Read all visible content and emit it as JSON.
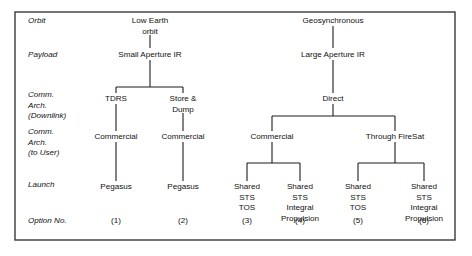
{
  "figure": {
    "type": "tree-diagram",
    "frame": {
      "x": 15,
      "y": 12,
      "width": 440,
      "height": 228,
      "border_color": "#3a3a3a"
    },
    "text_color": "#111111",
    "line_color": "#1c1c1c"
  },
  "row_labels": [
    {
      "id": "orbit",
      "lines": [
        "Orbit"
      ],
      "x": 28,
      "y": 23
    },
    {
      "id": "payload",
      "lines": [
        "Payload"
      ],
      "x": 28,
      "y": 57
    },
    {
      "id": "comm-arch-downlink",
      "lines": [
        "Comm.",
        "Arch.",
        "(Downlink)"
      ],
      "x": 28,
      "y": 97
    },
    {
      "id": "comm-arch-to-user",
      "lines": [
        "Comm.",
        "Arch.",
        "(to User)"
      ],
      "x": 28,
      "y": 134
    },
    {
      "id": "launch",
      "lines": [
        "Launch"
      ],
      "x": 28,
      "y": 187
    },
    {
      "id": "option-no",
      "lines": [
        "Option No."
      ],
      "x": 28,
      "y": 223
    }
  ],
  "nodes": [
    {
      "id": "low-earth-orbit",
      "lines": [
        "Low Earth",
        "orbit"
      ],
      "cx": 150,
      "y": 23
    },
    {
      "id": "geosynchronous",
      "lines": [
        "Geosynchronous"
      ],
      "cx": 333,
      "y": 23
    },
    {
      "id": "small-aperture-ir",
      "lines": [
        "Small Aperture IR"
      ],
      "cx": 150,
      "y": 57
    },
    {
      "id": "large-aperture-ir",
      "lines": [
        "Large Aperture IR"
      ],
      "cx": 333,
      "y": 57
    },
    {
      "id": "tdrs",
      "lines": [
        "TDRS"
      ],
      "cx": 116,
      "y": 101
    },
    {
      "id": "store-and-dump",
      "lines": [
        "Store &",
        "Dump"
      ],
      "cx": 183,
      "y": 101
    },
    {
      "id": "direct",
      "lines": [
        "Direct"
      ],
      "cx": 333,
      "y": 101
    },
    {
      "id": "commercial-1",
      "lines": [
        "Commercial"
      ],
      "cx": 116,
      "y": 139
    },
    {
      "id": "commercial-2",
      "lines": [
        "Commercial"
      ],
      "cx": 183,
      "y": 139
    },
    {
      "id": "commercial-3",
      "lines": [
        "Commercial"
      ],
      "cx": 272,
      "y": 139
    },
    {
      "id": "through-firesat",
      "lines": [
        "Through FireSat"
      ],
      "cx": 395,
      "y": 139
    },
    {
      "id": "pegasus-1",
      "lines": [
        "Pegasus"
      ],
      "cx": 116,
      "y": 189
    },
    {
      "id": "pegasus-2",
      "lines": [
        "Pegasus"
      ],
      "cx": 183,
      "y": 189
    },
    {
      "id": "shared-sts-tos-3",
      "lines": [
        "Shared",
        "STS",
        "TOS"
      ],
      "cx": 247,
      "y": 189
    },
    {
      "id": "shared-sts-integral-propulsion-4",
      "lines": [
        "Shared",
        "STS",
        "Integral",
        "Propulsion"
      ],
      "cx": 300,
      "y": 189
    },
    {
      "id": "shared-sts-tos-5",
      "lines": [
        "Shared",
        "STS",
        "TOS"
      ],
      "cx": 358,
      "y": 189
    },
    {
      "id": "shared-sts-integral-propulsion-6",
      "lines": [
        "Shared",
        "STS",
        "Integral",
        "Propulsion"
      ],
      "cx": 424,
      "y": 189
    }
  ],
  "options": [
    {
      "id": "option-1",
      "label": "(1)",
      "cx": 116,
      "y": 223
    },
    {
      "id": "option-2",
      "label": "(2)",
      "cx": 183,
      "y": 223
    },
    {
      "id": "option-3",
      "label": "(3)",
      "cx": 247,
      "y": 223
    },
    {
      "id": "option-4",
      "label": "(4)",
      "cx": 300,
      "y": 223
    },
    {
      "id": "option-5",
      "label": "(5)",
      "cx": 358,
      "y": 223
    },
    {
      "id": "option-6",
      "label": "(6)",
      "cx": 424,
      "y": 223
    }
  ],
  "connectors": [
    {
      "id": "leo-to-small-ir",
      "d": "M150,35 L150,48"
    },
    {
      "id": "geo-to-large-ir",
      "d": "M333,26 L333,48"
    },
    {
      "id": "small-ir-to-downlink-bus",
      "d": "M150,60 L150,87"
    },
    {
      "id": "downlink-bus-leo",
      "d": "M116,87 L183,87"
    },
    {
      "id": "downlink-bus-leo-left-drop",
      "d": "M116,87 L116,93"
    },
    {
      "id": "downlink-bus-leo-right-drop",
      "d": "M183,87 L183,93"
    },
    {
      "id": "large-ir-to-direct",
      "d": "M333,60 L333,93"
    },
    {
      "id": "tdrs-to-commercial-1",
      "d": "M116,104 L116,131"
    },
    {
      "id": "store-dump-to-commercial-2",
      "d": "M183,113 L183,131"
    },
    {
      "id": "direct-to-user-bus",
      "d": "M333,104 L333,116"
    },
    {
      "id": "user-bus-geo",
      "d": "M272,116 L395,116"
    },
    {
      "id": "user-bus-left-drop",
      "d": "M272,116 L272,131"
    },
    {
      "id": "user-bus-right-drop",
      "d": "M395,116 L395,131"
    },
    {
      "id": "commercial-1-to-pegasus-1",
      "d": "M116,142 L116,181"
    },
    {
      "id": "commercial-2-to-pegasus-2",
      "d": "M183,142 L183,181"
    },
    {
      "id": "commercial-3-to-launch-bus",
      "d": "M272,142 L272,163"
    },
    {
      "id": "launch-bus-commercial-3",
      "d": "M247,163 L300,163"
    },
    {
      "id": "launch-bus-c3-left-drop",
      "d": "M247,163 L247,181"
    },
    {
      "id": "launch-bus-c3-right-drop",
      "d": "M300,163 L300,181"
    },
    {
      "id": "firesat-to-launch-bus",
      "d": "M395,142 L395,163"
    },
    {
      "id": "launch-bus-firesat",
      "d": "M358,163 L424,163"
    },
    {
      "id": "launch-bus-fs-left-drop",
      "d": "M358,163 L358,181"
    },
    {
      "id": "launch-bus-fs-right-drop",
      "d": "M424,163 L424,181"
    }
  ]
}
